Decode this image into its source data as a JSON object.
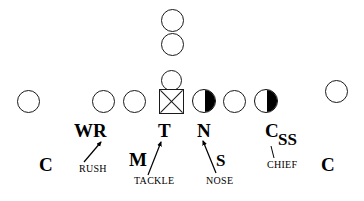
{
  "diagram": {
    "colors": {
      "stroke": "#1a1a1a",
      "fill_dark": "#000000",
      "background": "#ffffff"
    },
    "players": [
      {
        "id": "offense-back-deep",
        "symbol": "circle-open",
        "name": "offensive-back-deep"
      },
      {
        "id": "offense-back-near",
        "symbol": "circle-open",
        "name": "offensive-back-near"
      },
      {
        "id": "offense-quarterback",
        "symbol": "circle-open",
        "name": "offensive-quarterback"
      },
      {
        "id": "offense-center",
        "symbol": "square-x",
        "name": "offensive-center"
      },
      {
        "id": "offense-line-left-outer",
        "symbol": "circle-open",
        "name": "offensive-lineman-left-outer"
      },
      {
        "id": "offense-line-left-inner",
        "symbol": "circle-open",
        "name": "offensive-lineman-left-inner"
      },
      {
        "id": "offense-line-right-inner",
        "symbol": "circle-open",
        "name": "offensive-lineman-right-inner"
      },
      {
        "id": "offense-wide-left",
        "symbol": "circle-open",
        "name": "offensive-receiver-left"
      },
      {
        "id": "offense-wide-right",
        "symbol": "circle-open",
        "name": "offensive-receiver-right"
      },
      {
        "id": "defense-nose",
        "symbol": "circle-half",
        "name": "defender-nose"
      },
      {
        "id": "defense-chief",
        "symbol": "circle-half",
        "name": "defender-chief"
      }
    ],
    "position_labels": [
      {
        "id": "wr",
        "text": "WR",
        "size": "major"
      },
      {
        "id": "t",
        "text": "T",
        "size": "major"
      },
      {
        "id": "n",
        "text": "N",
        "size": "major"
      },
      {
        "id": "c-strong",
        "text": "C",
        "size": "major"
      },
      {
        "id": "ss",
        "text": "SS",
        "size": "mid"
      },
      {
        "id": "m",
        "text": "M",
        "size": "major"
      },
      {
        "id": "s",
        "text": "S",
        "size": "mid"
      },
      {
        "id": "c-left",
        "text": "C",
        "size": "major"
      },
      {
        "id": "c-right",
        "text": "C",
        "size": "major"
      }
    ],
    "callouts": [
      {
        "id": "rush",
        "text": "RUSH",
        "points_to": "wr"
      },
      {
        "id": "tackle",
        "text": "TACKLE",
        "points_to": "t"
      },
      {
        "id": "nose",
        "text": "NOSE",
        "points_to": "n"
      },
      {
        "id": "chief",
        "text": "CHIEF",
        "points_to": "c-strong"
      }
    ]
  }
}
